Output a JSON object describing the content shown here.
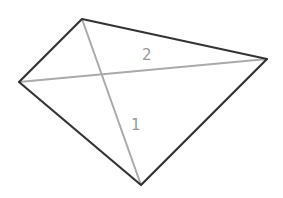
{
  "diagram": {
    "type": "quadrilateral-with-diagonals",
    "colors": {
      "outline": "#333333",
      "diagonal": "#aaaaaa",
      "label": "#999999",
      "background": "#ffffff"
    },
    "vertices": {
      "top": [
        82,
        19
      ],
      "right": [
        267,
        59
      ],
      "bottom": [
        141,
        185
      ],
      "left": [
        19,
        82
      ]
    },
    "diagonals": [
      {
        "id": "1",
        "label": "1",
        "from": "top",
        "to": "bottom",
        "label_pos": [
          131,
          130
        ]
      },
      {
        "id": "2",
        "label": "2",
        "from": "left",
        "to": "right",
        "label_pos": [
          142,
          60
        ]
      }
    ]
  }
}
